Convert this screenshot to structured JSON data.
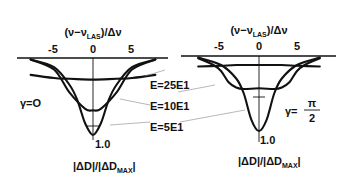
{
  "figure": {
    "x_axis_label": "(ν−ν_LAS)/Δν",
    "y_axis_label": "|ΔD|/|ΔD_MAX|",
    "energy_labels": [
      "E=25E1",
      "E=10E1",
      "E=5E1"
    ]
  },
  "chart_data": [
    {
      "type": "line",
      "panel": "left",
      "title": "γ = 0",
      "gamma_label": "γ=O",
      "xlabel": "(ν−ν_LAS)/Δν",
      "ylabel": "|ΔD|/|ΔD_MAX|",
      "x_ticks": [
        "-5",
        "0",
        "5"
      ],
      "xlim": [
        -8,
        8
      ],
      "y_tick": "1.0",
      "ylim": [
        0,
        1.0
      ],
      "y_inverted": true,
      "series": [
        {
          "name": "E=25E1",
          "x": [
            -8,
            -5,
            -3,
            0,
            3,
            5,
            8
          ],
          "y": [
            0.22,
            0.26,
            0.27,
            0.28,
            0.27,
            0.26,
            0.22
          ]
        },
        {
          "name": "E=10E1",
          "x": [
            -8,
            -5,
            -3,
            -1,
            0,
            1,
            3,
            5,
            8
          ],
          "y": [
            0.02,
            0.15,
            0.45,
            0.66,
            0.68,
            0.66,
            0.45,
            0.15,
            0.02
          ]
        },
        {
          "name": "E=5E1",
          "x": [
            -8,
            -5,
            -3,
            -2,
            -1,
            0,
            1,
            2,
            3,
            5,
            8
          ],
          "y": [
            0.02,
            0.12,
            0.35,
            0.55,
            0.85,
            1.0,
            0.85,
            0.55,
            0.35,
            0.12,
            0.02
          ]
        }
      ]
    },
    {
      "type": "line",
      "panel": "right",
      "title": "γ = π/2",
      "gamma_label": "γ=",
      "gamma_fraction": {
        "numerator": "π",
        "denominator": "2"
      },
      "xlabel": "(ν−ν_LAS)/Δν",
      "ylabel": "|ΔD|/|ΔD_MAX|",
      "x_ticks": [
        "-5",
        "0",
        "5"
      ],
      "xlim": [
        -8,
        8
      ],
      "y_tick": "1.0",
      "ylim": [
        0,
        1.0
      ],
      "y_inverted": true,
      "series": [
        {
          "name": "E=25E1",
          "x": [
            -8,
            -5,
            -3,
            0,
            3,
            5,
            8
          ],
          "y": [
            0.14,
            0.13,
            0.12,
            0.12,
            0.12,
            0.13,
            0.14
          ]
        },
        {
          "name": "E=10E1",
          "x": [
            -8,
            -6,
            -5,
            -4,
            -3,
            -2,
            0,
            2,
            3,
            4,
            5,
            6,
            8
          ],
          "y": [
            0.03,
            0.12,
            0.2,
            0.35,
            0.42,
            0.44,
            0.43,
            0.44,
            0.42,
            0.35,
            0.2,
            0.12,
            0.03
          ]
        },
        {
          "name": "E=5E1",
          "x": [
            -8,
            -5,
            -3,
            -2,
            -1,
            0,
            1,
            2,
            3,
            5,
            8
          ],
          "y": [
            0.02,
            0.12,
            0.3,
            0.5,
            0.85,
            1.0,
            0.85,
            0.5,
            0.3,
            0.12,
            0.02
          ]
        }
      ]
    }
  ]
}
